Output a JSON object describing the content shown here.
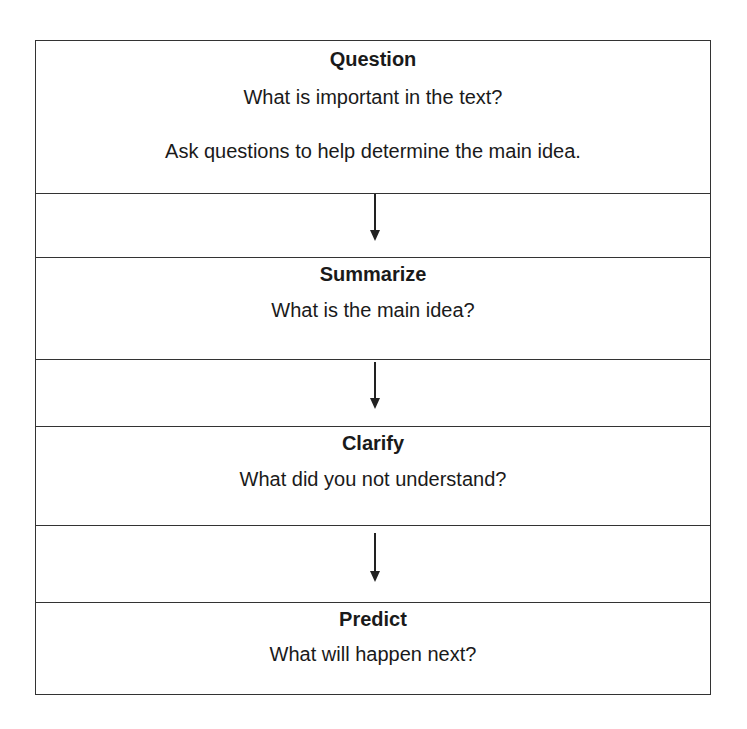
{
  "diagram": {
    "type": "flowchart",
    "direction": "top-to-bottom",
    "steps": [
      {
        "title": "Question",
        "lines": [
          "What is important in the text?",
          "Ask questions to help determine the main idea."
        ]
      },
      {
        "title": "Summarize",
        "lines": [
          "What is the main idea?"
        ]
      },
      {
        "title": "Clarify",
        "lines": [
          "What did you not understand?"
        ]
      },
      {
        "title": "Predict",
        "lines": [
          "What will happen next?"
        ]
      }
    ],
    "connectors": [
      {
        "from": "Question",
        "to": "Summarize",
        "icon": "down-arrow-icon"
      },
      {
        "from": "Summarize",
        "to": "Clarify",
        "icon": "down-arrow-icon"
      },
      {
        "from": "Clarify",
        "to": "Predict",
        "icon": "down-arrow-icon"
      }
    ],
    "colors": {
      "border": "#333333",
      "text": "#1a1a1a",
      "background": "#ffffff"
    }
  }
}
